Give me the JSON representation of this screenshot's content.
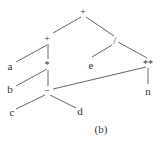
{
  "diagram": {
    "type": "expression-tree",
    "caption": "(b)",
    "nodes": {
      "root_plus": "+",
      "left_plus": "+",
      "div": "/",
      "a": "a",
      "mul": "*",
      "e": "e",
      "pow": "**",
      "b": "b",
      "minus": "−",
      "n": "n",
      "c": "c",
      "d": "d"
    },
    "edges": [
      [
        "+ (root)",
        "+ (left)"
      ],
      [
        "+ (root)",
        "/"
      ],
      [
        "+ (left)",
        "a"
      ],
      [
        "+ (left)",
        "*"
      ],
      [
        "/",
        "e"
      ],
      [
        "/",
        "**"
      ],
      [
        "*",
        "b"
      ],
      [
        "*",
        "−"
      ],
      [
        "**",
        "−"
      ],
      [
        "**",
        "n"
      ],
      [
        "−",
        "c"
      ],
      [
        "−",
        "d"
      ]
    ]
  }
}
